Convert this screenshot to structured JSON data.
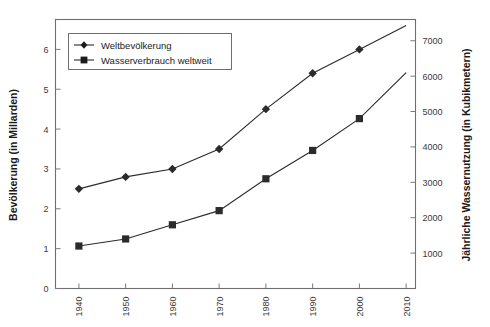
{
  "chart_data": {
    "type": "line",
    "title": "",
    "xlabel": "",
    "ylabel": "Bevölkerung (in Millarden)",
    "y2label": "Jährliche Wassernutzung (in Kubikmetern)",
    "categories": [
      "1940",
      "1950",
      "1960",
      "1970",
      "1980",
      "1990",
      "2000",
      "2010"
    ],
    "x": [
      1940,
      1950,
      1960,
      1970,
      1980,
      1990,
      2000,
      2010
    ],
    "xlim": [
      1935,
      2012
    ],
    "xticks": [
      "1940",
      "1950",
      "1960",
      "1970",
      "1980",
      "1990",
      "2000",
      "2010"
    ],
    "ylim": [
      0,
      6.75
    ],
    "yticks": [
      "0",
      "1",
      "2",
      "3",
      "4",
      "5",
      "6"
    ],
    "y2lim": [
      0,
      7600
    ],
    "y2ticks": [
      "1000",
      "2000",
      "3000",
      "4000",
      "5000",
      "6000",
      "7000"
    ],
    "grid": false,
    "legend_position": "top-left",
    "series": [
      {
        "name": "Weltbevölkerung",
        "axis": "left",
        "marker": "diamond",
        "color": "#2b2b2b",
        "values": [
          2.5,
          2.8,
          3.0,
          3.5,
          4.5,
          5.4,
          6.0,
          6.6
        ],
        "marker_values": [
          2.5,
          2.8,
          3.0,
          3.5,
          4.5,
          5.4,
          6.0,
          null
        ]
      },
      {
        "name": "Wasserverbrauch weltweit",
        "axis": "right",
        "marker": "square",
        "color": "#2b2b2b",
        "values": [
          1200,
          1400,
          1800,
          2200,
          3100,
          3900,
          4800,
          6100
        ],
        "marker_values": [
          1200,
          1400,
          1800,
          2200,
          3100,
          3900,
          4800,
          null
        ]
      }
    ]
  },
  "legend": {
    "items": [
      {
        "label": "Weltbevölkerung",
        "marker": "diamond"
      },
      {
        "label": "Wasserverbrauch weltweit",
        "marker": "square"
      }
    ]
  },
  "axes": {
    "left_title": "Bevölkerung (in Millarden)",
    "right_title": "Jährliche Wassernutzung (in Kubikmetern)",
    "left_ticks": [
      "0",
      "1",
      "2",
      "3",
      "4",
      "5",
      "6"
    ],
    "right_ticks": [
      "1000",
      "2000",
      "3000",
      "4000",
      "5000",
      "6000",
      "7000"
    ],
    "x_ticks": [
      "1940",
      "1950",
      "1960",
      "1970",
      "1980",
      "1990",
      "2000",
      "2010"
    ]
  },
  "colors": {
    "series": "#2b2b2b",
    "frame": "#6e6e6e",
    "tick_label": "#3a3a3a",
    "axis_title": "#1a1a1a",
    "background": "#ffffff"
  }
}
